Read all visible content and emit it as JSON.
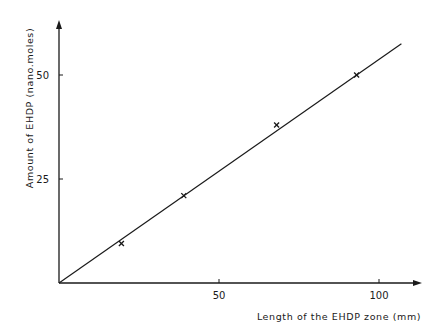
{
  "chart_data": {
    "type": "scatter",
    "title": "",
    "xlabel": "Length of the EHDP zone (mm)",
    "ylabel": "Amount of EHDP (nano.moles)",
    "xlim": [
      0,
      112
    ],
    "ylim": [
      0,
      62
    ],
    "x_ticks": [
      50,
      100
    ],
    "y_ticks": [
      25,
      50
    ],
    "x_tick_labels": [
      "50",
      "100"
    ],
    "y_tick_labels": [
      "25",
      "50"
    ],
    "grid": false,
    "legend": null,
    "marker": "x",
    "series": [
      {
        "name": "measured",
        "type": "scatter",
        "x": [
          19.5,
          39,
          68,
          93
        ],
        "y": [
          9.5,
          21,
          38,
          50
        ]
      },
      {
        "name": "fit line",
        "type": "line",
        "x": [
          0,
          107
        ],
        "y": [
          0,
          57.5
        ]
      }
    ],
    "colors": {
      "ink": "#1a1a1a",
      "background": "#ffffff"
    }
  }
}
